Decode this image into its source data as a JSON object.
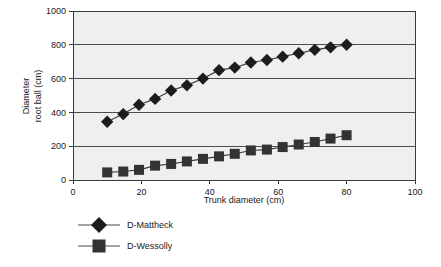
{
  "chart_data": {
    "type": "line",
    "title": "",
    "xlabel": "Trunk diameter (cm)",
    "ylabel_line1": "Diameter",
    "ylabel_line2": "root ball (cm)",
    "xlim": [
      0,
      100
    ],
    "ylim": [
      0,
      1000
    ],
    "xticks": [
      0,
      20,
      40,
      60,
      80,
      100
    ],
    "yticks": [
      0,
      200,
      400,
      600,
      800,
      1000
    ],
    "xtick_labels": [
      "0",
      "20",
      "40",
      "60",
      "80",
      "100"
    ],
    "ytick_labels": [
      "0",
      "200",
      "400",
      "600",
      "800",
      "1000"
    ],
    "grid": "horizontal",
    "legend_position": "below-left",
    "x": [
      10,
      14.7,
      19.3,
      24,
      28.7,
      33.3,
      38,
      42.7,
      47.3,
      52,
      56.7,
      61.3,
      66,
      70.7,
      75.3,
      80
    ],
    "series": [
      {
        "name": "D-Mattheck",
        "marker": "diamond",
        "color": "#1c1c1c",
        "values": [
          345,
          390,
          445,
          480,
          530,
          560,
          600,
          650,
          665,
          695,
          710,
          730,
          750,
          770,
          785,
          800
        ]
      },
      {
        "name": "D-Wessolly",
        "marker": "square",
        "color": "#333333",
        "values": [
          45,
          50,
          60,
          85,
          95,
          110,
          125,
          140,
          155,
          175,
          180,
          195,
          210,
          225,
          245,
          265
        ]
      }
    ]
  },
  "legend": {
    "items": [
      {
        "label": "D-Mattheck",
        "marker": "diamond"
      },
      {
        "label": "D-Wessolly",
        "marker": "square"
      }
    ]
  },
  "colors": {
    "plot_background": "#efefef",
    "page_background": "#ffffff",
    "axis": "#3a3a3a",
    "gridline": "#4d4d4d",
    "marker_primary": "#1c1c1c",
    "marker_secondary": "#333333"
  }
}
